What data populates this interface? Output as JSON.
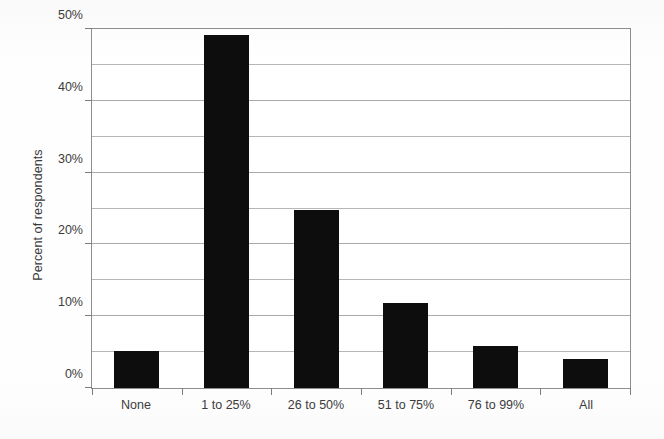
{
  "chart_data": {
    "type": "bar",
    "title": "",
    "xlabel": "",
    "ylabel": "Percent of respondents",
    "categories": [
      "None",
      "1 to 25%",
      "26 to 50%",
      "51 to 75%",
      "76 to 99%",
      "All"
    ],
    "values": [
      5.1,
      49.2,
      24.8,
      11.9,
      5.8,
      4.0
    ],
    "ylim": [
      0,
      50
    ],
    "y_tick_labels": [
      "0%",
      "10%",
      "20%",
      "30%",
      "40%",
      "50%"
    ],
    "y_tick_values": [
      0,
      10,
      20,
      30,
      40,
      50
    ],
    "gridline_values": [
      5,
      10,
      15,
      20,
      25,
      30,
      35,
      40,
      45
    ],
    "grid": true,
    "legend": "none",
    "bar_color": "#0d0d0d",
    "axis_color": "#8e8e8e",
    "gridline_color": "#a9a9a9",
    "text_color": "#3c3c3c",
    "background_color": "#ffffff"
  }
}
